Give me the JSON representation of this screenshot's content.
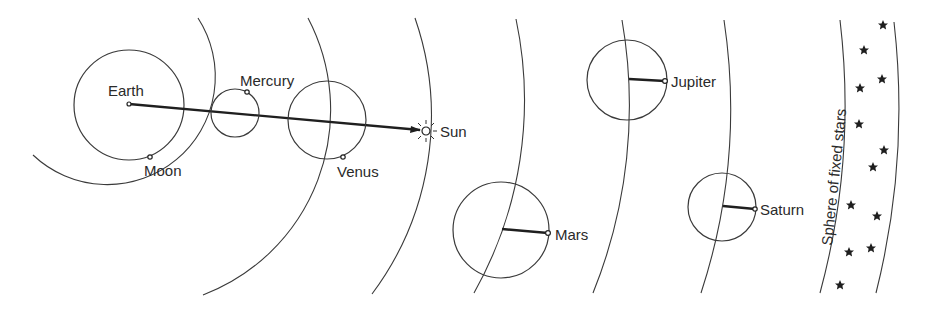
{
  "diagram": {
    "type": "geocentric-model",
    "background": "#ffffff",
    "line_color": "#3a3a3a",
    "labels": {
      "earth": "Earth",
      "moon": "Moon",
      "mercury": "Mercury",
      "venus": "Venus",
      "sun": "Sun",
      "mars": "Mars",
      "jupiter": "Jupiter",
      "saturn": "Saturn",
      "fixed_stars": "Sphere of fixed stars"
    },
    "bodies": [
      {
        "name": "Earth",
        "role": "center"
      },
      {
        "name": "Moon",
        "role": "on-circle"
      },
      {
        "name": "Mercury",
        "role": "epicycle"
      },
      {
        "name": "Venus",
        "role": "epicycle"
      },
      {
        "name": "Sun",
        "role": "deferent-point"
      },
      {
        "name": "Mars",
        "role": "epicycle"
      },
      {
        "name": "Jupiter",
        "role": "epicycle"
      },
      {
        "name": "Saturn",
        "role": "epicycle"
      }
    ],
    "star_count": 12,
    "star_icon": "star-icon",
    "sun_icon": "sun-rays-icon"
  }
}
